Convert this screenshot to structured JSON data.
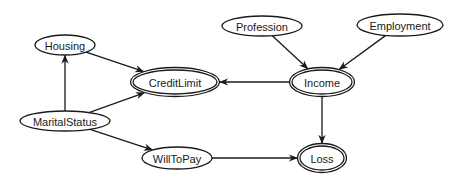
{
  "diagram": {
    "type": "bayesian-network",
    "nodes": [
      {
        "id": "housing",
        "label": "Housing",
        "cx": 65,
        "cy": 45,
        "rx": 30,
        "ry": 10,
        "double": false
      },
      {
        "id": "profession",
        "label": "Profession",
        "cx": 262,
        "cy": 26,
        "rx": 40,
        "ry": 10,
        "double": false
      },
      {
        "id": "employment",
        "label": "Employment",
        "cx": 400,
        "cy": 25,
        "rx": 43,
        "ry": 11,
        "double": false
      },
      {
        "id": "creditlimit",
        "label": "CreditLimit",
        "cx": 175,
        "cy": 82,
        "rx": 42,
        "ry": 12,
        "double": true
      },
      {
        "id": "income",
        "label": "Income",
        "cx": 322,
        "cy": 82,
        "rx": 30,
        "ry": 12,
        "double": true
      },
      {
        "id": "maritalstatus",
        "label": "MaritalStatus",
        "cx": 65,
        "cy": 121,
        "rx": 45,
        "ry": 10,
        "double": false
      },
      {
        "id": "willtopay",
        "label": "WillToPay",
        "cx": 177,
        "cy": 158,
        "rx": 35,
        "ry": 11,
        "double": false
      },
      {
        "id": "loss",
        "label": "Loss",
        "cx": 322,
        "cy": 158,
        "rx": 22,
        "ry": 12,
        "double": true
      }
    ],
    "edges": [
      {
        "from": "housing",
        "to": "creditlimit"
      },
      {
        "from": "maritalstatus",
        "to": "housing"
      },
      {
        "from": "maritalstatus",
        "to": "creditlimit"
      },
      {
        "from": "maritalstatus",
        "to": "willtopay"
      },
      {
        "from": "profession",
        "to": "income"
      },
      {
        "from": "employment",
        "to": "income"
      },
      {
        "from": "income",
        "to": "creditlimit"
      },
      {
        "from": "income",
        "to": "loss"
      },
      {
        "from": "willtopay",
        "to": "loss"
      }
    ]
  }
}
